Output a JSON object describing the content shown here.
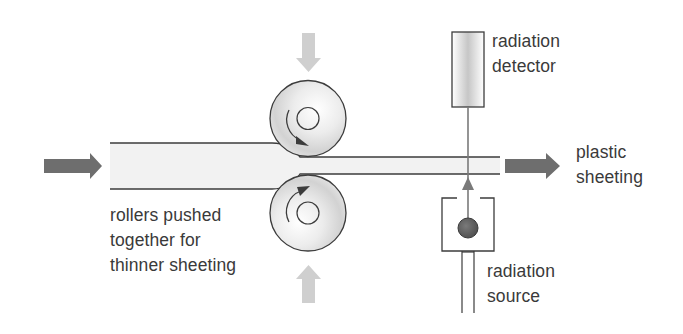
{
  "diagram": {
    "labels": {
      "rollers": [
        "rollers pushed",
        "together for",
        "thinner sheeting"
      ],
      "detector": [
        "radiation",
        "detector"
      ],
      "product": [
        "plastic",
        "sheeting"
      ],
      "source": [
        "radiation",
        "source"
      ]
    },
    "components": {
      "input_arrow": {
        "direction": "right",
        "color": "#6e6e6e"
      },
      "output_arrow": {
        "direction": "right",
        "color": "#6e6e6e"
      },
      "top_pressure_arrow": {
        "direction": "down",
        "color": "#cfcfcf"
      },
      "bottom_pressure_arrow": {
        "direction": "up",
        "color": "#cfcfcf"
      },
      "top_roller": {
        "rotation": "clockwise"
      },
      "bottom_roller": {
        "rotation": "anticlockwise"
      },
      "sheet": {
        "thick_section": "left",
        "thin_section": "right",
        "fill": "#f2f2f2"
      },
      "detector_box": {
        "fill_center": "#c8c8c8"
      },
      "source_ball": {
        "color": "#5c5c5c"
      },
      "beam": {
        "direction": "up",
        "color": "#7a7a7a"
      }
    },
    "colors": {
      "outline": "#3c3c3c",
      "dark_arrow": "#6e6e6e",
      "light_arrow": "#cfcfcf",
      "text": "#3a3a3a"
    }
  }
}
